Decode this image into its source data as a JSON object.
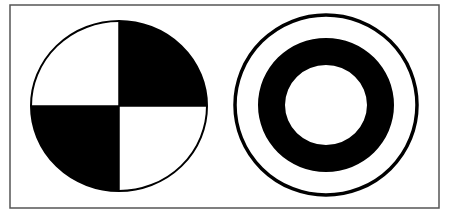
{
  "figure": {
    "background": "#ffffff",
    "frame": {
      "x": 10,
      "y": 5,
      "width": 429,
      "height": 203,
      "stroke": "#555555",
      "stroke_width": 1.5
    },
    "ink_color": "#000000",
    "paper_color": "#ffffff",
    "left_symbol": {
      "name": "quartered-circle",
      "description": "Circle divided into four quadrants; top-right and bottom-left filled black",
      "cx": 119,
      "cy": 106,
      "rx": 88,
      "ry": 85,
      "filled_quadrants": [
        "top-right",
        "bottom-left"
      ],
      "outline_width": 2
    },
    "right_symbol": {
      "name": "concentric-ring-target",
      "description": "Thin outer circle with a thick black ring inside and a white center",
      "cx": 326,
      "cy": 105,
      "outer_circle": {
        "rx": 91,
        "ry": 90,
        "stroke_width": 3.5
      },
      "black_ring_outer": {
        "rx": 68,
        "ry": 67
      },
      "black_ring_inner": {
        "rx": 41,
        "ry": 40
      }
    }
  }
}
